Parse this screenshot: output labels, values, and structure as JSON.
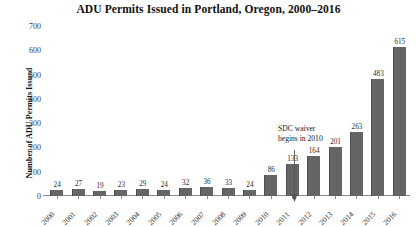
{
  "chart_data": {
    "type": "bar",
    "title": "ADU Permits Issued in Portland, Oregon, 2000–2016",
    "xlabel": "",
    "ylabel": "Number of ADU Permits Issued",
    "categories": [
      "2000",
      "2001",
      "2002",
      "2003",
      "2004",
      "2005",
      "2006",
      "2007",
      "2008",
      "2009",
      "2010",
      "2011",
      "2012",
      "2013",
      "2014",
      "2015",
      "2016"
    ],
    "values": [
      24,
      27,
      19,
      23,
      29,
      24,
      32,
      36,
      33,
      24,
      86,
      133,
      164,
      201,
      263,
      483,
      615
    ],
    "ylim": [
      0,
      700
    ],
    "yticks": [
      0,
      100,
      200,
      300,
      400,
      500,
      600,
      700
    ],
    "ytick_labels": [
      "0",
      "100",
      "200",
      "300",
      "400",
      "500",
      "600",
      "700"
    ],
    "grid": false,
    "legend": null,
    "bar_color": "#656565",
    "data_labels_shown": true,
    "annotations": [
      {
        "text_line_1": "SDC waiver",
        "text_line_2": "begins in 2010",
        "points_to_category": "2010",
        "arrow": "down-arrow"
      }
    ]
  }
}
